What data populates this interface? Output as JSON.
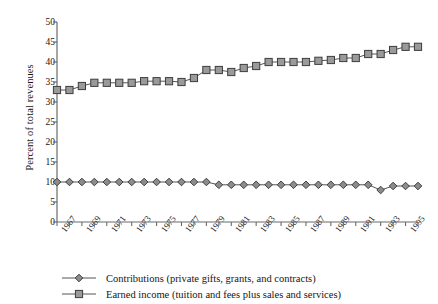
{
  "chart_data": {
    "type": "line",
    "title": "",
    "xlabel": "",
    "ylabel": "Percent of total revenues",
    "ylim": [
      0,
      50
    ],
    "ytick_values": [
      0,
      5,
      10,
      15,
      20,
      25,
      30,
      35,
      40,
      45,
      50
    ],
    "ytick_labels": [
      "0",
      "5",
      "10",
      "15",
      "20",
      "25",
      "30",
      "35",
      "40",
      "45",
      "50"
    ],
    "grid": false,
    "legend_position": "bottom-left",
    "x": [
      1967,
      1968,
      1969,
      1970,
      1971,
      1972,
      1973,
      1974,
      1975,
      1976,
      1977,
      1978,
      1979,
      1980,
      1981,
      1982,
      1983,
      1984,
      1985,
      1986,
      1987,
      1988,
      1989,
      1990,
      1991,
      1992,
      1993,
      1994,
      1995,
      1996
    ],
    "xtick_labels": [
      "1967",
      "1969",
      "1971",
      "1973",
      "1975",
      "1977",
      "1979",
      "1981",
      "1983",
      "1985",
      "1987",
      "1989",
      "1991",
      "1993",
      "1995"
    ],
    "xtick_values": [
      1967,
      1969,
      1971,
      1973,
      1975,
      1977,
      1979,
      1981,
      1983,
      1985,
      1987,
      1989,
      1991,
      1993,
      1995
    ],
    "series": [
      {
        "name": "Contributions (private gifts, grants, and contracts)",
        "marker": "diamond",
        "color": "#8c8c8c",
        "edge_color": "#3d3d3d",
        "values": [
          10.0,
          10.0,
          10.0,
          10.0,
          10.0,
          10.0,
          10.0,
          10.0,
          10.0,
          10.0,
          10.0,
          10.0,
          10.0,
          9.3,
          9.3,
          9.3,
          9.3,
          9.3,
          9.3,
          9.3,
          9.3,
          9.3,
          9.3,
          9.3,
          9.3,
          9.3,
          8.0,
          9.0,
          9.0,
          9.0
        ]
      },
      {
        "name": "Earned income (tuition and fees plus sales and services)",
        "marker": "square",
        "color": "#9a9a9a",
        "edge_color": "#3d3d3d",
        "values": [
          33.0,
          33.0,
          34.0,
          34.8,
          34.8,
          34.8,
          34.8,
          35.2,
          35.2,
          35.2,
          35.0,
          36.0,
          38.0,
          38.0,
          37.5,
          38.5,
          39.0,
          40.0,
          40.0,
          40.0,
          40.0,
          40.3,
          40.5,
          41.0,
          41.0,
          42.0,
          42.0,
          43.0,
          43.8,
          43.8
        ]
      }
    ]
  },
  "legend": [
    {
      "label": "Contributions (private gifts, grants, and contracts)",
      "marker": "diamond"
    },
    {
      "label": "Earned income (tuition and fees plus sales and services)",
      "marker": "square"
    }
  ],
  "colors": {
    "marker_fill_contributions": "#8c8c8c",
    "marker_fill_earned": "#9a9a9a",
    "marker_edge": "#3d3d3d",
    "line": "#555555",
    "axis": "#6b6b6b",
    "text": "#151515"
  }
}
